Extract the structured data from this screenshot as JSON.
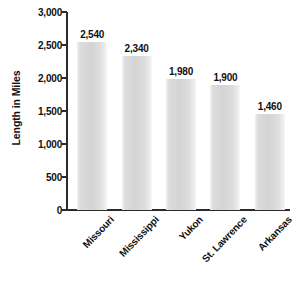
{
  "chart_data": {
    "type": "bar",
    "title": "",
    "subtitle": "",
    "xlabel": "",
    "ylabel": "Length in Miles",
    "categories": [
      "Missouri",
      "Mississippi",
      "Yukon",
      "St. Lawrence",
      "Arkansas"
    ],
    "values": [
      2540,
      2340,
      1980,
      1900,
      1460
    ],
    "value_labels": [
      "2,540",
      "2,340",
      "1,980",
      "1,900",
      "1,460"
    ],
    "ylim": [
      0,
      3000
    ],
    "ytick_values": [
      0,
      500,
      1000,
      1500,
      2000,
      2500,
      3000
    ],
    "ytick_labels": [
      "0",
      "500",
      "1,000",
      "1,500",
      "2,000",
      "2,500",
      "3,000"
    ],
    "grid": false,
    "legend": false,
    "legend_position": "none",
    "series": [
      {
        "name": "Length in Miles",
        "values": [
          2540,
          2340,
          1980,
          1900,
          1460
        ]
      }
    ],
    "colors": {
      "bar_fill_light": "#f2f2f2",
      "bar_fill_mid": "#d4d4d4",
      "bar_fill_edge": "#f7f7f7",
      "axis": "#2b2b2b",
      "text": "#111111",
      "background": "#ffffff"
    }
  }
}
